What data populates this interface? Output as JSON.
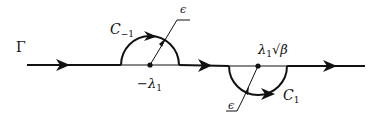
{
  "diagram": {
    "type": "contour",
    "contour_label": "Γ",
    "colors": {
      "stroke": "#111111",
      "background": "#ffffff"
    },
    "left_indentation": {
      "label_main": "C",
      "label_sub": "−1",
      "side": "above",
      "center_label_main": "−λ",
      "center_label_sub": "1",
      "radius_label": "ϵ"
    },
    "right_indentation": {
      "label_main": "C",
      "label_sub": "1",
      "side": "below",
      "center_label_main": "λ",
      "center_label_sub": "1",
      "center_label_suffix": "√β",
      "radius_label": "ϵ"
    }
  }
}
